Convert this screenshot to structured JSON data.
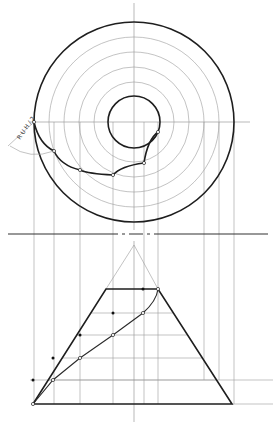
{
  "colors": {
    "ink": "#1e1e1e",
    "construction": "#9a9a9a",
    "paper": "#ffffff"
  },
  "top_view": {
    "center": [
      134,
      122
    ],
    "outer_radius": 100,
    "inner_radius": 26,
    "construction_radii": [
      85,
      70,
      55,
      40
    ],
    "axis_h": [
      30,
      250
    ],
    "axis_v": [
      3,
      230
    ],
    "spiral_points": [
      [
        34,
        122
      ],
      [
        54,
        151
      ],
      [
        80,
        170
      ],
      [
        113,
        175
      ],
      [
        144,
        163
      ],
      [
        158,
        132
      ]
    ]
  },
  "annotation": {
    "text": "R U H / 2",
    "x": 20,
    "y": 140,
    "rotate": -55
  },
  "separator": {
    "y": 234,
    "x1": 8,
    "x2": 268
  },
  "projectors": [
    34,
    54,
    80,
    113,
    144,
    158,
    204,
    219,
    234
  ],
  "front_view": {
    "apex": [
      134,
      245
    ],
    "top": {
      "y": 289,
      "x1": 106,
      "x2": 158
    },
    "base": {
      "y": 404,
      "x1": 33,
      "x2": 232
    },
    "levels": [
      313,
      335,
      358,
      380
    ],
    "helix_points": [
      [
        33,
        404
      ],
      [
        53,
        380
      ],
      [
        80,
        358
      ],
      [
        113,
        335
      ],
      [
        143,
        313
      ],
      [
        158,
        289
      ]
    ],
    "true_points": [
      [
        33,
        380
      ],
      [
        53,
        358
      ],
      [
        80,
        335
      ],
      [
        113,
        313
      ],
      [
        143,
        289
      ]
    ]
  }
}
